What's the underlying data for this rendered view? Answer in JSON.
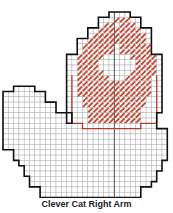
{
  "caption": "Clever Cat Right Arm",
  "grid": {
    "origin_x": 3,
    "origin_y": 12,
    "cell": 5.3
  },
  "colors": {
    "grid": "#b0b0b0",
    "outline": "#111111",
    "stitch": "#c8452f",
    "red_outline": "#b43a2e"
  },
  "rows": [
    [
      [
        20,
        24
      ]
    ],
    [
      [
        18,
        26
      ]
    ],
    [
      [
        18,
        26
      ]
    ],
    [
      [
        16,
        28
      ]
    ],
    [
      [
        16,
        28
      ]
    ],
    [
      [
        14,
        28
      ]
    ],
    [
      [
        14,
        28
      ]
    ],
    [
      [
        14,
        28
      ]
    ],
    [
      [
        12,
        30
      ]
    ],
    [
      [
        12,
        30
      ]
    ],
    [
      [
        12,
        30
      ]
    ],
    [
      [
        12,
        30
      ]
    ],
    [
      [
        12,
        30
      ]
    ],
    [
      [
        12,
        30
      ]
    ],
    [
      [
        2,
        6
      ],
      [
        12,
        30
      ]
    ],
    [
      [
        0,
        8
      ],
      [
        12,
        30
      ]
    ],
    [
      [
        0,
        8
      ],
      [
        12,
        30
      ]
    ],
    [
      [
        0,
        10
      ],
      [
        12,
        30
      ]
    ],
    [
      [
        0,
        10
      ],
      [
        12,
        30
      ]
    ],
    [
      [
        0,
        12
      ],
      [
        13,
        29
      ]
    ],
    [
      [
        0,
        12
      ],
      [
        13,
        29
      ]
    ],
    [
      [
        0,
        15
      ],
      [
        15,
        29
      ]
    ],
    [
      [
        0,
        31
      ]
    ],
    [
      [
        0,
        31
      ]
    ],
    [
      [
        0,
        31
      ]
    ],
    [
      [
        0,
        31
      ]
    ],
    [
      [
        2,
        31
      ]
    ],
    [
      [
        2,
        31
      ]
    ],
    [
      [
        3,
        30
      ]
    ],
    [
      [
        4,
        30
      ]
    ],
    [
      [
        4,
        29
      ]
    ],
    [
      [
        5,
        29
      ]
    ],
    [
      [
        5,
        28
      ]
    ],
    [
      [
        7,
        26
      ]
    ],
    [
      [
        7,
        26
      ]
    ]
  ],
  "stitches": [
    [
      1,
      21
    ],
    [
      1,
      22
    ],
    [
      1,
      23
    ],
    [
      2,
      19
    ],
    [
      2,
      20
    ],
    [
      2,
      22
    ],
    [
      2,
      23
    ],
    [
      2,
      24
    ],
    [
      3,
      18
    ],
    [
      3,
      19
    ],
    [
      3,
      20
    ],
    [
      3,
      21
    ],
    [
      3,
      22
    ],
    [
      3,
      23
    ],
    [
      3,
      24
    ],
    [
      3,
      25
    ],
    [
      4,
      17
    ],
    [
      4,
      18
    ],
    [
      4,
      19
    ],
    [
      4,
      20
    ],
    [
      4,
      21
    ],
    [
      4,
      22
    ],
    [
      4,
      23
    ],
    [
      4,
      24
    ],
    [
      4,
      25
    ],
    [
      4,
      26
    ],
    [
      5,
      16
    ],
    [
      5,
      17
    ],
    [
      5,
      18
    ],
    [
      5,
      19
    ],
    [
      5,
      20
    ],
    [
      5,
      21
    ],
    [
      5,
      22
    ],
    [
      5,
      23
    ],
    [
      5,
      24
    ],
    [
      5,
      25
    ],
    [
      5,
      26
    ],
    [
      6,
      15
    ],
    [
      6,
      16
    ],
    [
      6,
      17
    ],
    [
      6,
      18
    ],
    [
      6,
      19
    ],
    [
      6,
      20
    ],
    [
      6,
      22
    ],
    [
      6,
      23
    ],
    [
      6,
      24
    ],
    [
      6,
      25
    ],
    [
      6,
      26
    ],
    [
      6,
      27
    ],
    [
      7,
      15
    ],
    [
      7,
      16
    ],
    [
      7,
      17
    ],
    [
      7,
      18
    ],
    [
      7,
      19
    ],
    [
      7,
      20
    ],
    [
      7,
      22
    ],
    [
      7,
      23
    ],
    [
      7,
      24
    ],
    [
      7,
      25
    ],
    [
      7,
      26
    ],
    [
      7,
      27
    ],
    [
      8,
      14
    ],
    [
      8,
      15
    ],
    [
      8,
      16
    ],
    [
      8,
      17
    ],
    [
      8,
      18
    ],
    [
      8,
      24
    ],
    [
      8,
      25
    ],
    [
      8,
      26
    ],
    [
      8,
      27
    ],
    [
      8,
      28
    ],
    [
      9,
      14
    ],
    [
      9,
      15
    ],
    [
      9,
      16
    ],
    [
      9,
      17
    ],
    [
      9,
      25
    ],
    [
      9,
      26
    ],
    [
      9,
      27
    ],
    [
      9,
      28
    ],
    [
      10,
      14
    ],
    [
      10,
      15
    ],
    [
      10,
      16
    ],
    [
      10,
      17
    ],
    [
      10,
      25
    ],
    [
      10,
      26
    ],
    [
      10,
      27
    ],
    [
      10,
      28
    ],
    [
      11,
      14
    ],
    [
      11,
      15
    ],
    [
      11,
      16
    ],
    [
      11,
      17
    ],
    [
      11,
      18
    ],
    [
      11,
      24
    ],
    [
      11,
      25
    ],
    [
      11,
      26
    ],
    [
      11,
      27
    ],
    [
      11,
      28
    ],
    [
      12,
      14
    ],
    [
      12,
      15
    ],
    [
      12,
      16
    ],
    [
      12,
      17
    ],
    [
      12,
      18
    ],
    [
      12,
      19
    ],
    [
      12,
      23
    ],
    [
      12,
      24
    ],
    [
      12,
      25
    ],
    [
      12,
      26
    ],
    [
      12,
      27
    ],
    [
      13,
      14
    ],
    [
      13,
      15
    ],
    [
      13,
      16
    ],
    [
      13,
      17
    ],
    [
      13,
      18
    ],
    [
      13,
      19
    ],
    [
      13,
      20
    ],
    [
      13,
      21
    ],
    [
      13,
      22
    ],
    [
      13,
      23
    ],
    [
      13,
      24
    ],
    [
      13,
      25
    ],
    [
      13,
      26
    ],
    [
      13,
      27
    ],
    [
      14,
      14
    ],
    [
      14,
      15
    ],
    [
      14,
      16
    ],
    [
      14,
      17
    ],
    [
      14,
      18
    ],
    [
      14,
      19
    ],
    [
      14,
      20
    ],
    [
      14,
      21
    ],
    [
      14,
      22
    ],
    [
      14,
      23
    ],
    [
      14,
      24
    ],
    [
      14,
      25
    ],
    [
      14,
      26
    ],
    [
      14,
      27
    ],
    [
      15,
      14
    ],
    [
      15,
      15
    ],
    [
      15,
      16
    ],
    [
      15,
      17
    ],
    [
      15,
      18
    ],
    [
      15,
      19
    ],
    [
      15,
      20
    ],
    [
      15,
      21
    ],
    [
      15,
      22
    ],
    [
      15,
      23
    ],
    [
      15,
      24
    ],
    [
      15,
      25
    ],
    [
      15,
      26
    ],
    [
      15,
      27
    ],
    [
      16,
      15
    ],
    [
      16,
      16
    ],
    [
      16,
      17
    ],
    [
      16,
      18
    ],
    [
      16,
      19
    ],
    [
      16,
      20
    ],
    [
      16,
      21
    ],
    [
      16,
      22
    ],
    [
      16,
      23
    ],
    [
      16,
      24
    ],
    [
      16,
      25
    ],
    [
      16,
      26
    ],
    [
      17,
      15
    ],
    [
      17,
      16
    ],
    [
      17,
      17
    ],
    [
      17,
      18
    ],
    [
      17,
      19
    ],
    [
      17,
      20
    ],
    [
      17,
      21
    ],
    [
      17,
      22
    ],
    [
      17,
      23
    ],
    [
      17,
      24
    ],
    [
      17,
      25
    ],
    [
      17,
      26
    ],
    [
      18,
      16
    ],
    [
      18,
      17
    ],
    [
      18,
      18
    ],
    [
      18,
      19
    ],
    [
      18,
      20
    ],
    [
      18,
      21
    ],
    [
      18,
      22
    ],
    [
      18,
      23
    ],
    [
      18,
      24
    ],
    [
      18,
      25
    ],
    [
      19,
      16
    ],
    [
      19,
      17
    ],
    [
      19,
      18
    ],
    [
      19,
      19
    ],
    [
      19,
      20
    ],
    [
      19,
      21
    ],
    [
      19,
      22
    ],
    [
      19,
      23
    ],
    [
      19,
      24
    ],
    [
      19,
      25
    ],
    [
      20,
      16
    ],
    [
      20,
      17
    ],
    [
      20,
      18
    ],
    [
      20,
      19
    ],
    [
      20,
      20
    ],
    [
      20,
      21
    ],
    [
      20,
      22
    ],
    [
      20,
      23
    ],
    [
      20,
      24
    ],
    [
      20,
      25
    ]
  ],
  "red_region": {
    "x1": 13,
    "x2": 29,
    "y_top": 12,
    "y_bottom": 21
  },
  "center_line_col": 21
}
